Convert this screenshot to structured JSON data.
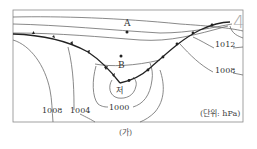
{
  "figure": {
    "caption": "(가)",
    "corner_label": "4",
    "unit_label": "(단위: hPa)"
  },
  "points": [
    {
      "label": "A",
      "x": 127,
      "y": 30
    },
    {
      "label": "B",
      "x": 121,
      "y": 56
    }
  ],
  "low_center": {
    "label": "저",
    "x": 121,
    "y": 89
  },
  "isobars": [
    {
      "value": "1012",
      "label_x": 219,
      "label_y": 47
    },
    {
      "value": "1008",
      "label_x": 218,
      "label_y": 72
    },
    {
      "value": "1008",
      "label_x": 44,
      "label_y": 113
    },
    {
      "value": "1004",
      "label_x": 72,
      "label_y": 113
    },
    {
      "value": "1000",
      "label_x": 110,
      "label_y": 109
    }
  ],
  "fronts": [
    "cold-front-west",
    "warm-front-east"
  ]
}
